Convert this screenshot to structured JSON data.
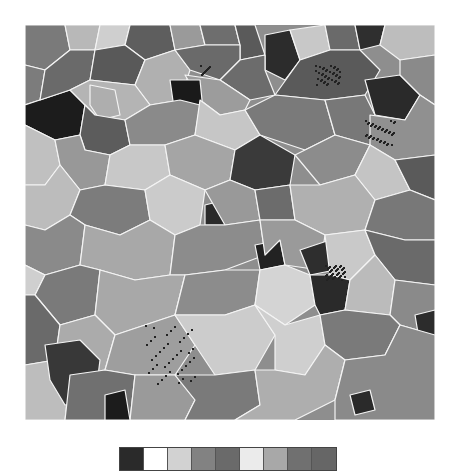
{
  "figure": {
    "type": "grain-orientation-map",
    "background": "#ffffff",
    "boundary_color": "#f4f4f4"
  },
  "legend": {
    "swatches": [
      "#2a2a2a",
      "#ffffff",
      "#d2d2d2",
      "#828282",
      "#6a6a6a",
      "#ebebeb",
      "#a8a8a8",
      "#707070",
      "#666666"
    ]
  },
  "grains": [
    {
      "c": "#7a7a7a",
      "p": "0,0 40,0 45,25 20,45 0,40"
    },
    {
      "c": "#b8b8b8",
      "p": "40,0 75,0 70,25 45,25"
    },
    {
      "c": "#cfcfcf",
      "p": "75,0 105,0 100,20 70,25"
    },
    {
      "c": "#5e5e5e",
      "p": "105,0 145,0 150,25 120,35 100,20"
    },
    {
      "c": "#9a9a9a",
      "p": "145,0 175,0 180,20 150,25"
    },
    {
      "c": "#6e6e6e",
      "p": "175,0 210,0 215,20 180,20"
    },
    {
      "c": "#5a5a5a",
      "p": "210,0 230,0 240,30 215,35 215,20"
    },
    {
      "c": "#2c2c2c",
      "p": "240,10 265,5 275,35 260,55 240,45"
    },
    {
      "c": "#c8c8c8",
      "p": "265,5 300,0 305,25 275,35"
    },
    {
      "c": "#6a6a6a",
      "p": "300,0 330,0 335,25 305,25"
    },
    {
      "c": "#2f2f2f",
      "p": "330,0 360,0 355,20 335,25"
    },
    {
      "c": "#bdbdbd",
      "p": "360,0 410,0 410,30 375,35 355,20"
    },
    {
      "c": "#7c7c7c",
      "p": "0,40 20,45 15,75 0,80"
    },
    {
      "c": "#1c1c1c",
      "p": "0,80 15,75 45,65 60,80 55,110 30,115 10,105 0,100"
    },
    {
      "c": "#6a6a6a",
      "p": "20,45 45,25 70,25 65,55 45,65 15,75"
    },
    {
      "c": "#595959",
      "p": "70,25 100,20 120,35 110,60 65,55"
    },
    {
      "c": "#b0b0b0",
      "p": "120,35 150,25 165,45 155,75 125,80 110,60"
    },
    {
      "c": "#6a6a6a",
      "p": "150,25 180,20 215,20 215,35 195,55 165,45"
    },
    {
      "c": "#6c6c6c",
      "p": "215,35 240,30 240,45 250,70 225,75 195,55"
    },
    {
      "c": "#9c9c9c",
      "p": "160,50 195,55 225,75 220,85 195,90 175,75"
    },
    {
      "c": "#1a1a1a",
      "p": "145,55 175,55 178,85 150,90"
    },
    {
      "c": "#b4b4b4",
      "p": "45,65 65,55 110,60 125,80 100,95 70,90 60,80"
    },
    {
      "c": "#aeaeae",
      "p": "65,60 90,65 95,90 75,95 65,80"
    },
    {
      "c": "#5a5a5a",
      "p": "250,70 275,35 305,25 335,25 355,45 340,70 300,75"
    },
    {
      "c": "#2a2a2a",
      "p": "340,55 375,50 395,70 380,95 350,90"
    },
    {
      "c": "#8a8a8a",
      "p": "375,35 410,30 410,80 395,70 375,50"
    },
    {
      "c": "#c0c0c0",
      "p": "0,100 10,105 30,115 35,140 20,160 0,160"
    },
    {
      "c": "#5c5c5c",
      "p": "55,110 60,80 70,90 100,95 105,120 85,130 60,125"
    },
    {
      "c": "#989898",
      "p": "30,115 55,110 60,125 85,130 80,160 55,165 35,140"
    },
    {
      "c": "#8a8a8a",
      "p": "100,95 125,80 155,75 175,80 170,110 140,120 105,120"
    },
    {
      "c": "#c6c6c6",
      "p": "175,75 195,90 220,85 235,110 210,125 170,110"
    },
    {
      "c": "#7a7a7a",
      "p": "220,85 250,70 300,75 310,110 280,125 235,110"
    },
    {
      "c": "#787878",
      "p": "300,75 340,70 350,90 345,120 310,110"
    },
    {
      "c": "#909090",
      "p": "345,90 380,95 395,70 410,80 410,130 370,135 345,120"
    },
    {
      "c": "#2c2c2c",
      "p": "170,135 195,130 200,160 180,165"
    },
    {
      "c": "#c8c8c8",
      "p": "85,130 105,120 140,120 145,150 120,165 80,160"
    },
    {
      "c": "#a5a5a5",
      "p": "140,120 170,110 210,125 205,155 180,165 145,150"
    },
    {
      "c": "#3a3a3a",
      "p": "210,125 235,110 270,130 265,160 230,165 205,155"
    },
    {
      "c": "#8c8c8c",
      "p": "270,130 280,125 310,110 345,120 330,150 295,160"
    },
    {
      "c": "#c4c4c4",
      "p": "330,150 345,120 370,135 385,165 350,175"
    },
    {
      "c": "#5a5a5a",
      "p": "370,135 410,130 410,175 385,165"
    },
    {
      "c": "#bcbcbc",
      "p": "0,160 20,160 35,140 55,165 45,190 20,205 0,200"
    },
    {
      "c": "#7c7c7c",
      "p": "55,165 80,160 120,165 125,195 95,210 60,200 45,190"
    },
    {
      "c": "#cbcbcb",
      "p": "145,150 180,165 175,200 150,210 125,195 120,165"
    },
    {
      "c": "#2a2a2a",
      "p": "180,180 200,175 200,200 180,200"
    },
    {
      "c": "#999999",
      "p": "180,165 205,155 230,165 235,195 200,200"
    },
    {
      "c": "#6c6c6c",
      "p": "230,165 265,160 270,195 235,195"
    },
    {
      "c": "#b0b0b0",
      "p": "265,160 295,160 330,150 350,175 340,205 300,210 270,195"
    },
    {
      "c": "#787878",
      "p": "350,175 385,165 410,175 410,215 380,215 340,205"
    },
    {
      "c": "#8a8a8a",
      "p": "0,200 20,205 45,190 60,200 55,240 20,250 0,240"
    },
    {
      "c": "#a8a8a8",
      "p": "60,200 95,210 125,195 150,210 145,250 110,255 75,245 55,240"
    },
    {
      "c": "#8c8c8c",
      "p": "150,210 175,200 200,200 235,195 240,230 200,245 160,250 145,250"
    },
    {
      "c": "#222222",
      "p": "230,220 255,215 260,240 235,245"
    },
    {
      "c": "#9a9a9a",
      "p": "235,195 270,195 300,210 295,245 260,240 255,215 240,230"
    },
    {
      "c": "#2e2e2e",
      "p": "275,225 305,215 310,245 285,250"
    },
    {
      "c": "#c9c9c9",
      "p": "300,210 340,205 350,230 325,255 305,250"
    },
    {
      "c": "#6a6a6a",
      "p": "340,205 380,215 410,215 410,260 370,255 350,230"
    },
    {
      "c": "#cfcfcf",
      "p": "0,240 20,250 10,270 0,270"
    },
    {
      "c": "#7a7a7a",
      "p": "20,250 55,240 75,245 70,290 35,300 10,270"
    },
    {
      "c": "#a8a8a8",
      "p": "75,245 110,255 145,250 160,250 150,290 120,300 90,310 70,290"
    },
    {
      "c": "#8c8c8c",
      "p": "160,250 200,245 235,245 230,280 200,290 150,290"
    },
    {
      "c": "#d4d4d4",
      "p": "235,245 260,240 285,250 290,280 260,300 230,280"
    },
    {
      "c": "#2a2a2a",
      "p": "285,250 305,250 325,255 320,285 295,290 290,280"
    },
    {
      "c": "#bbbbbb",
      "p": "325,255 350,230 370,255 365,290 320,285"
    },
    {
      "c": "#8a8a8a",
      "p": "370,255 410,260 410,310 375,300 365,290"
    },
    {
      "c": "#6a6a6a",
      "p": "0,270 10,270 35,300 30,335 0,340"
    },
    {
      "c": "#ababab",
      "p": "35,300 70,290 90,310 80,345 45,350 30,335"
    },
    {
      "c": "#9e9e9e",
      "p": "90,310 120,300 150,290 170,320 150,350 110,350 80,345"
    },
    {
      "c": "#cccccc",
      "p": "150,290 200,290 230,280 250,310 230,345 190,350 170,320"
    },
    {
      "c": "#cfcfcf",
      "p": "230,280 260,300 295,290 300,320 280,350 250,345 250,310"
    },
    {
      "c": "#7a7a7a",
      "p": "295,290 320,285 365,290 375,300 360,330 320,335 300,320"
    },
    {
      "c": "#2c2c2c",
      "p": "390,290 410,285 410,330 395,320"
    },
    {
      "c": "#bdbdbd",
      "p": "0,340 30,335 45,350 40,395 0,395"
    },
    {
      "c": "#383838",
      "p": "20,320 55,315 75,335 70,375 40,380 25,355"
    },
    {
      "c": "#707070",
      "p": "45,350 80,345 110,350 105,395 40,395"
    },
    {
      "c": "#9a9a9a",
      "p": "110,350 150,350 170,375 160,395 105,395"
    },
    {
      "c": "#1c1c1c",
      "p": "80,370 100,365 105,395 80,395"
    },
    {
      "c": "#7a7a7a",
      "p": "150,350 190,350 230,345 235,380 210,395 160,395 170,375"
    },
    {
      "c": "#aeaeae",
      "p": "230,345 250,345 280,350 300,320 320,335 310,375 270,395 210,395 235,380"
    },
    {
      "c": "#8a8a8a",
      "p": "320,335 360,330 375,300 410,310 410,395 310,395 310,375"
    },
    {
      "c": "#2a2a2a",
      "p": "325,370 345,365 350,385 330,390"
    }
  ]
}
